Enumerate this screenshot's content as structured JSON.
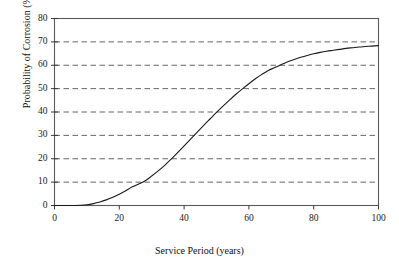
{
  "chart_data": {
    "type": "line",
    "title": "",
    "subtitle": "",
    "xlabel": "Service Period (years)",
    "ylabel": "Probability of Corrosion (%)",
    "xlim": [
      0,
      100
    ],
    "ylim": [
      0,
      80
    ],
    "xticks": [
      "0",
      "20",
      "40",
      "60",
      "80",
      "100"
    ],
    "xtick_values": [
      0,
      20,
      40,
      60,
      80,
      100
    ],
    "yticks": [
      "0",
      "10",
      "20",
      "30",
      "40",
      "50",
      "60",
      "70",
      "80"
    ],
    "ytick_values": [
      0,
      10,
      20,
      30,
      40,
      50,
      60,
      70,
      80
    ],
    "grid": {
      "horizontal": true,
      "vertical": false,
      "style": "dashed",
      "color": "#555555"
    },
    "legend": {
      "present": false,
      "entries": [],
      "position": "none"
    },
    "annotations": [],
    "series": [
      {
        "name": "Probability of Corrosion",
        "color": "#1a1a1a",
        "linewidth": 1.1,
        "x": [
          0,
          5,
          8,
          10,
          12,
          14,
          16,
          18,
          20,
          22,
          24,
          26,
          28,
          30,
          32,
          34,
          36,
          38,
          40,
          42,
          44,
          46,
          48,
          50,
          52,
          54,
          56,
          58,
          60,
          62,
          64,
          66,
          68,
          70,
          72,
          74,
          76,
          78,
          80,
          82,
          84,
          86,
          88,
          90,
          92,
          94,
          96,
          98,
          100
        ],
        "values": [
          0,
          0,
          0.1,
          0.3,
          0.8,
          1.5,
          2.4,
          3.5,
          4.8,
          6.3,
          8.0,
          9.2,
          10.6,
          12.6,
          14.8,
          17.2,
          19.8,
          22.6,
          25.5,
          28.4,
          31.3,
          34.2,
          37.0,
          39.8,
          42.5,
          45.1,
          47.6,
          49.9,
          52.1,
          54.2,
          56.1,
          57.8,
          59.0,
          60.3,
          61.5,
          62.5,
          63.4,
          64.2,
          64.9,
          65.5,
          66.0,
          66.4,
          66.8,
          67.2,
          67.5,
          67.8,
          68.0,
          68.2,
          68.4
        ]
      }
    ]
  },
  "axes": {
    "frame_color": "#5a5a5a",
    "tick_color": "#3a3a3a"
  }
}
